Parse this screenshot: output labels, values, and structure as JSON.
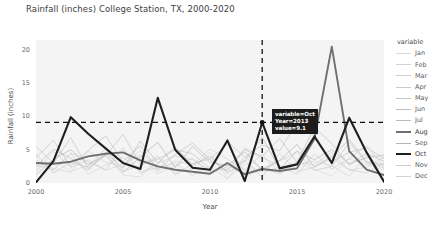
{
  "chart_data": {
    "type": "line",
    "title": "Rainfall (inches) College Station, TX, 2000-2020",
    "xlabel": "Year",
    "ylabel": "Rainfall (inches)",
    "xlim": [
      2000,
      2020
    ],
    "ylim": [
      0,
      21.5
    ],
    "xticks": [
      "2000",
      "2005",
      "2010",
      "2015",
      "2020"
    ],
    "xtick_values": [
      2000,
      2005,
      2010,
      2015,
      2020
    ],
    "yticks": [
      "0",
      "5",
      "10",
      "15",
      "20"
    ],
    "ytick_values": [
      0,
      5,
      10,
      15,
      20
    ],
    "grid": false,
    "legend_position": "right",
    "legend_title": "variable",
    "x": [
      2000,
      2001,
      2002,
      2003,
      2004,
      2005,
      2006,
      2007,
      2008,
      2009,
      2010,
      2011,
      2012,
      2013,
      2014,
      2015,
      2016,
      2017,
      2018,
      2019,
      2020
    ],
    "highlighted_series": [
      "Aug",
      "Oct"
    ],
    "series": [
      {
        "name": "Jan",
        "color": "#d8d8d8",
        "width": 0.8,
        "highlight": false,
        "values": [
          2.1,
          3.4,
          1.8,
          2.6,
          4.1,
          1.2,
          0.9,
          3.8,
          1.5,
          2.2,
          4.6,
          0.7,
          2.9,
          1.6,
          2.4,
          3.1,
          2.0,
          1.1,
          3.6,
          2.8,
          1.9
        ]
      },
      {
        "name": "Feb",
        "color": "#d4d4d4",
        "width": 0.8,
        "highlight": false,
        "values": [
          3.2,
          2.0,
          4.4,
          1.3,
          2.7,
          3.9,
          1.7,
          2.3,
          3.0,
          1.1,
          2.5,
          0.6,
          4.0,
          2.2,
          1.4,
          2.9,
          3.3,
          2.6,
          1.0,
          4.2,
          2.1
        ]
      },
      {
        "name": "Mar",
        "color": "#cfcfcf",
        "width": 0.8,
        "highlight": false,
        "values": [
          1.6,
          4.8,
          2.3,
          3.5,
          1.9,
          2.8,
          4.2,
          1.4,
          2.6,
          3.7,
          1.8,
          2.1,
          3.4,
          0.9,
          4.5,
          1.7,
          2.4,
          3.8,
          2.0,
          1.5,
          3.1
        ]
      },
      {
        "name": "Apr",
        "color": "#cacaca",
        "width": 0.8,
        "highlight": false,
        "values": [
          4.3,
          1.5,
          3.1,
          2.4,
          5.2,
          1.8,
          2.6,
          4.0,
          1.2,
          2.9,
          3.6,
          5.8,
          1.6,
          2.2,
          3.3,
          4.7,
          1.9,
          2.5,
          6.1,
          3.0,
          2.3
        ]
      },
      {
        "name": "May",
        "color": "#c4c4c4",
        "width": 0.8,
        "highlight": false,
        "values": [
          5.5,
          3.0,
          6.8,
          2.2,
          4.1,
          7.3,
          2.8,
          3.6,
          5.0,
          4.4,
          2.1,
          6.2,
          3.9,
          5.7,
          4.8,
          9.2,
          7.0,
          3.2,
          4.6,
          5.3,
          3.7
        ]
      },
      {
        "name": "Jun",
        "color": "#bfbfbf",
        "width": 0.8,
        "highlight": false,
        "values": [
          3.8,
          6.4,
          2.5,
          4.9,
          7.1,
          3.2,
          5.6,
          2.0,
          4.3,
          6.0,
          3.5,
          1.8,
          5.2,
          4.0,
          6.7,
          3.1,
          8.4,
          5.9,
          2.7,
          4.5,
          3.3
        ]
      },
      {
        "name": "Jul",
        "color": "#bababa",
        "width": 0.8,
        "highlight": false,
        "values": [
          2.4,
          5.1,
          3.7,
          1.9,
          4.6,
          2.2,
          6.3,
          3.0,
          5.4,
          2.7,
          4.0,
          1.5,
          3.3,
          6.9,
          2.1,
          4.8,
          3.5,
          5.0,
          2.9,
          3.8,
          4.2
        ]
      },
      {
        "name": "Aug",
        "color": "#6f6f6f",
        "width": 1.9,
        "highlight": true,
        "values": [
          3.0,
          2.9,
          3.2,
          4.0,
          4.4,
          4.6,
          3.4,
          2.5,
          2.0,
          1.7,
          1.4,
          3.0,
          1.3,
          2.1,
          1.8,
          2.2,
          6.6,
          20.5,
          4.8,
          2.0,
          1.2
        ]
      },
      {
        "name": "Sep",
        "color": "#b5b5b5",
        "width": 0.8,
        "highlight": false,
        "values": [
          1.2,
          3.6,
          5.0,
          2.8,
          4.2,
          1.6,
          3.9,
          6.1,
          2.3,
          5.5,
          3.1,
          2.6,
          4.7,
          1.9,
          3.4,
          5.8,
          2.4,
          4.0,
          6.5,
          3.2,
          2.7
        ]
      },
      {
        "name": "Oct",
        "color": "#1f1f1f",
        "width": 2.1,
        "highlight": true,
        "values": [
          0.1,
          3.3,
          9.9,
          7.4,
          5.2,
          3.0,
          2.1,
          12.8,
          5.0,
          2.3,
          2.0,
          6.4,
          0.3,
          9.1,
          2.2,
          2.8,
          7.0,
          3.0,
          9.8,
          4.6,
          0.2
        ]
      },
      {
        "name": "Nov",
        "color": "#cdcdcd",
        "width": 0.8,
        "highlight": false,
        "values": [
          2.7,
          1.9,
          4.5,
          3.2,
          2.0,
          5.3,
          1.4,
          2.9,
          4.1,
          3.5,
          1.7,
          2.4,
          5.0,
          3.8,
          2.6,
          1.3,
          4.4,
          2.1,
          3.7,
          5.6,
          2.5
        ]
      },
      {
        "name": "Dec",
        "color": "#d2d2d2",
        "width": 0.8,
        "highlight": false,
        "values": [
          3.5,
          2.2,
          1.6,
          4.8,
          3.1,
          2.5,
          4.9,
          1.8,
          3.3,
          2.7,
          5.1,
          3.6,
          2.0,
          4.3,
          1.5,
          3.0,
          2.8,
          4.6,
          1.9,
          2.4,
          3.9
        ]
      }
    ],
    "annotations": {
      "hline_value": 9.1,
      "vline_value": 2013,
      "marker_point": {
        "x": 2013,
        "y": 9.1
      }
    }
  },
  "tooltip": {
    "line1": "variable=Oct",
    "line2": "Year=2013",
    "line3": "value=9.1"
  }
}
